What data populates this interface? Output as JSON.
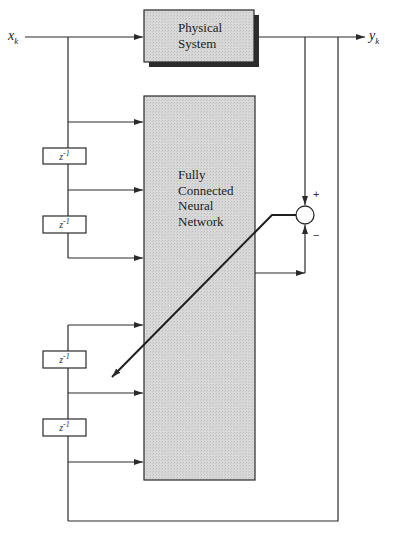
{
  "diagram": {
    "type": "block-diagram",
    "input": {
      "label": "x",
      "subscript": "k"
    },
    "output": {
      "label": "y",
      "subscript": "k"
    },
    "physical_system": {
      "line1": "Physical",
      "line2": "System"
    },
    "neural_network": {
      "line1": "Fully",
      "line2": "Connected",
      "line3": "Neural",
      "line4": "Network"
    },
    "delays": [
      {
        "label": "z",
        "exp": "-1"
      },
      {
        "label": "z",
        "exp": "-1"
      },
      {
        "label": "z",
        "exp": "-1"
      },
      {
        "label": "z",
        "exp": "-1"
      }
    ],
    "summer": {
      "plus": "+",
      "minus": "−"
    },
    "colors": {
      "line": "#2a2a2a",
      "block_fill": "#d6d6d6",
      "shadow": "#2b2b2b",
      "background": "#ffffff"
    }
  }
}
